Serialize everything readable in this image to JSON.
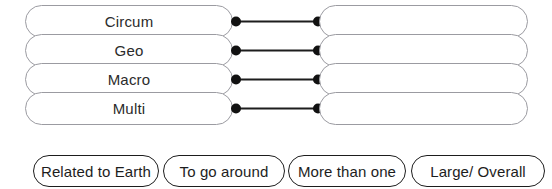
{
  "worksheet": {
    "type": "matching-exercise",
    "rows": [
      {
        "term": "Circum",
        "answer": "",
        "connector": {
          "left_dot": true,
          "right_dot": true,
          "line": true
        }
      },
      {
        "term": "Geo",
        "answer": "",
        "connector": {
          "left_dot": true,
          "right_dot": true,
          "line": true
        }
      },
      {
        "term": "Macro",
        "answer": "",
        "connector": {
          "left_dot": true,
          "right_dot": true,
          "line": true
        }
      },
      {
        "term": "Multi",
        "answer": "",
        "connector": {
          "left_dot": true,
          "right_dot": true,
          "line": true
        }
      }
    ],
    "answer_bank": [
      {
        "label": "Related to Earth"
      },
      {
        "label": "To go around"
      },
      {
        "label": "More than one"
      },
      {
        "label": "Large/ Overall"
      }
    ],
    "colors": {
      "pill_outline": "#9b9ba1",
      "bank_outline": "#1d1d1d",
      "connector": "#1d1d1d",
      "text": "#2b2b2b",
      "background": "#ffffff"
    }
  }
}
